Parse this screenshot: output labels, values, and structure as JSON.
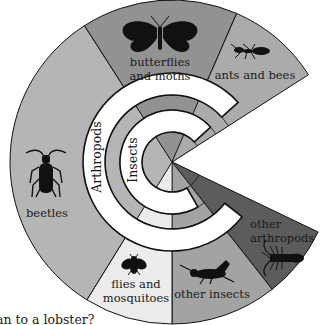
{
  "diagram": {
    "center": [
      172,
      162
    ],
    "radii": {
      "outer": 162,
      "band_outer": 89,
      "mid_ring_outer": 67,
      "mid_ring_inner": 52,
      "inner_pie": 30
    },
    "ring_labels": {
      "outer_band": "Arthropods",
      "inner_band": "Insects"
    },
    "segments": [
      {
        "id": "other-arthropods",
        "label_lines": [
          "other",
          "arthropods"
        ],
        "icon": "lobster-icon",
        "start_deg": 25.6,
        "end_deg": 51.8,
        "color": "#5c5c5c"
      },
      {
        "id": "other-insects",
        "label_lines": [
          "other insects"
        ],
        "icon": "grasshopper-icon",
        "start_deg": 51.8,
        "end_deg": 90,
        "color": "#a3a3a3"
      },
      {
        "id": "flies-and-mosquitoes",
        "label_lines": [
          "flies and",
          "mosquitoes"
        ],
        "icon": "fly-icon",
        "start_deg": 90,
        "end_deg": 121.7,
        "color": "#ececec"
      },
      {
        "id": "beetles",
        "label_lines": [
          "beetles"
        ],
        "icon": "beetle-icon",
        "start_deg": 121.7,
        "end_deg": 237.3,
        "color": "#b5b5b5"
      },
      {
        "id": "butterflies-and-moths",
        "label_lines": [
          "butterflies",
          "and moths"
        ],
        "icon": "butterfly-icon",
        "start_deg": 237.3,
        "end_deg": 293.5,
        "color": "#929292"
      },
      {
        "id": "ants-and-bees",
        "label_lines": [
          "ants and bees"
        ],
        "icon": "ant-icon",
        "start_deg": 293.5,
        "end_deg": 327.4,
        "color": "#ababab"
      }
    ],
    "caption": "an to a lobster?"
  }
}
